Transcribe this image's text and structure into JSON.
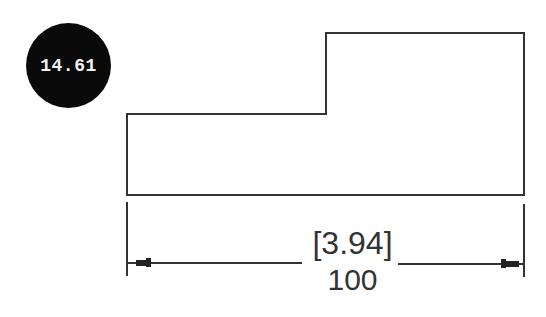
{
  "badge": {
    "value": "14.61",
    "color": "#0a0a0a",
    "text_color": "#f2f2f2"
  },
  "drawing": {
    "outline_color": "#333333",
    "shape_points": [
      [
        127,
        114
      ],
      [
        326,
        114
      ],
      [
        326,
        33
      ],
      [
        524,
        33
      ],
      [
        524,
        195
      ],
      [
        127,
        195
      ]
    ],
    "dimension": {
      "alternate_value": "[3.94]",
      "primary_value": "100",
      "line_y": 264,
      "x_start": 127,
      "x_end": 524,
      "arrow_style": "filled-tick"
    }
  }
}
